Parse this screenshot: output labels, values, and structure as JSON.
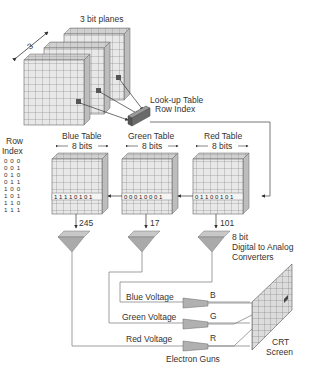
{
  "diagram": {
    "type": "color-lookup-table-frame-buffer",
    "bit_planes": {
      "label": "3  bit planes",
      "depth_label": "3",
      "count": 3,
      "pixel_bits": [
        "1",
        "0",
        "1"
      ]
    },
    "lookup_table_label": {
      "line1": "Look-up Table",
      "line2": "Row Index"
    },
    "row_index": {
      "title_line1": "Row",
      "title_line2": "Index",
      "values": [
        "0 0 0",
        "0 0 1",
        "0 1 0",
        "0 1 1",
        "1 0 0",
        "1 0 1",
        "1 1 0",
        "1 1 1"
      ],
      "selected": "1 0 1"
    },
    "tables": [
      {
        "id": "blue",
        "title": "Blue Table",
        "width_label": "8 bits",
        "row_bits": [
          "1",
          "1",
          "1",
          "1",
          "0",
          "1",
          "0",
          "1"
        ],
        "output": "245"
      },
      {
        "id": "green",
        "title": "Green Table",
        "width_label": "8 bits",
        "row_bits": [
          "0",
          "0",
          "0",
          "1",
          "0",
          "0",
          "0",
          "1"
        ],
        "output": "17"
      },
      {
        "id": "red",
        "title": "Red Table",
        "width_label": "8 bits",
        "row_bits": [
          "0",
          "1",
          "1",
          "0",
          "0",
          "1",
          "0",
          "1"
        ],
        "output": "101"
      }
    ],
    "dac_label": {
      "line1": "8 bit",
      "line2": "Digital to Analog",
      "line3": "Converters"
    },
    "voltages": [
      {
        "label": "Blue Voltage",
        "gun": "B"
      },
      {
        "label": "Green Voltage",
        "gun": "G"
      },
      {
        "label": "Red Voltage",
        "gun": "R"
      }
    ],
    "electron_guns_label": "Electron Guns",
    "crt_label": {
      "line1": "CRT",
      "line2": "Screen"
    },
    "colors": {
      "line": "#555555",
      "fill_light": "#e6e6e6",
      "fill_mid": "#c8c8c8",
      "fill_dark": "#8a8a8a",
      "grid": "#777777"
    }
  }
}
